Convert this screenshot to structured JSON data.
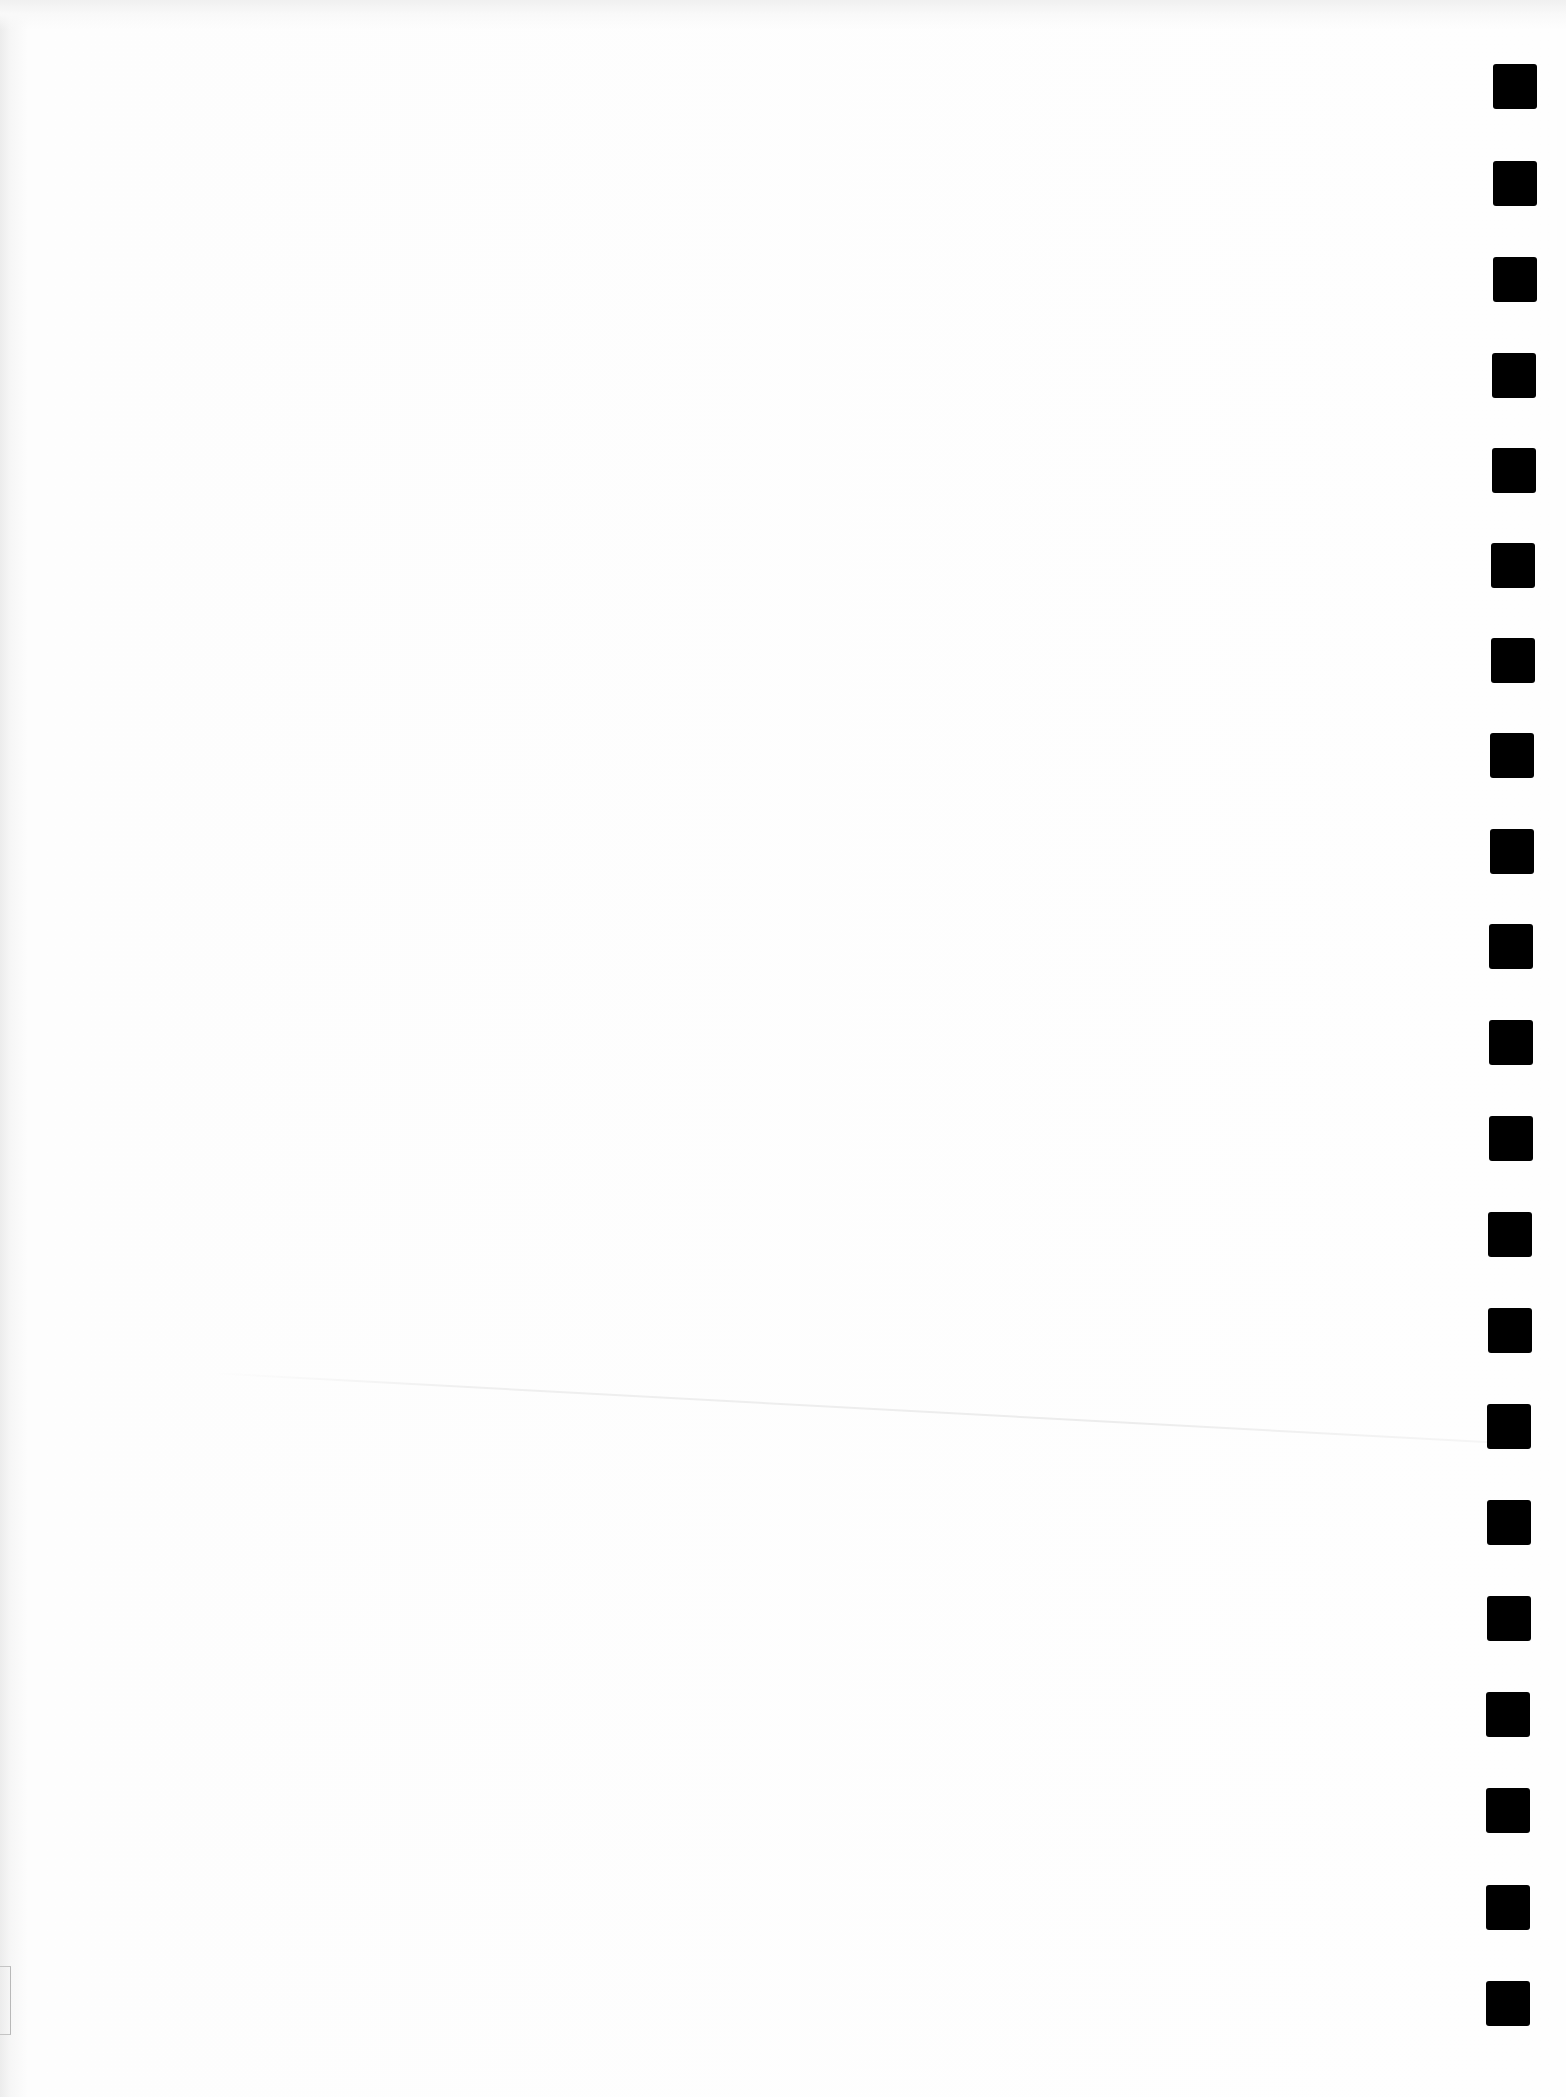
{
  "page": {
    "type": "scanned-blank-sheet",
    "background_color": "#fdfdfd",
    "visible_text": []
  },
  "timing_marks": {
    "count": 21,
    "color": "#000000",
    "size_px": [
      44,
      45
    ],
    "marks": [
      {
        "x": 1493,
        "y": 64
      },
      {
        "x": 1493,
        "y": 161
      },
      {
        "x": 1493,
        "y": 257
      },
      {
        "x": 1492,
        "y": 353
      },
      {
        "x": 1492,
        "y": 448
      },
      {
        "x": 1491,
        "y": 543
      },
      {
        "x": 1491,
        "y": 638
      },
      {
        "x": 1490,
        "y": 733
      },
      {
        "x": 1490,
        "y": 829
      },
      {
        "x": 1489,
        "y": 924
      },
      {
        "x": 1489,
        "y": 1020
      },
      {
        "x": 1489,
        "y": 1116
      },
      {
        "x": 1488,
        "y": 1212
      },
      {
        "x": 1488,
        "y": 1308
      },
      {
        "x": 1487,
        "y": 1404
      },
      {
        "x": 1487,
        "y": 1500
      },
      {
        "x": 1487,
        "y": 1596
      },
      {
        "x": 1486,
        "y": 1692
      },
      {
        "x": 1486,
        "y": 1788
      },
      {
        "x": 1486,
        "y": 1885
      },
      {
        "x": 1486,
        "y": 1981
      }
    ]
  },
  "artifacts": {
    "crease_line": true,
    "corner_bracket": true
  }
}
